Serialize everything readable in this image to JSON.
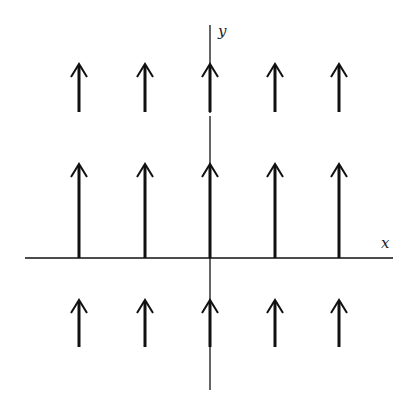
{
  "diagram": {
    "type": "vector-field",
    "axes": {
      "x_label": "x",
      "y_label": "y"
    },
    "colors": {
      "background": "#ffffff",
      "ink": "#111111"
    },
    "columns_x": [
      79,
      145,
      210,
      275,
      339
    ],
    "rows": [
      {
        "tip_y": 64,
        "tail_y": 112
      },
      {
        "tip_y": 164,
        "tail_y": 258
      },
      {
        "tip_y": 300,
        "tail_y": 347
      }
    ]
  }
}
